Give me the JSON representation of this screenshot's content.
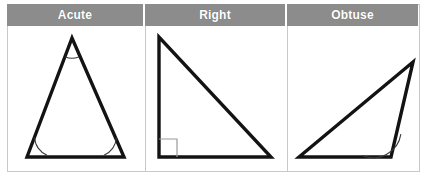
{
  "figure": {
    "columns": [
      {
        "id": "acute",
        "header": "Acute",
        "angle_marker": "arc",
        "marked_angles": [
          "apex",
          "bottom-left",
          "bottom-right"
        ]
      },
      {
        "id": "right",
        "header": "Right",
        "angle_marker": "square",
        "marked_angles": [
          "bottom-left"
        ]
      },
      {
        "id": "obtuse",
        "header": "Obtuse",
        "angle_marker": "arc",
        "marked_angles": [
          "bottom-right"
        ]
      }
    ],
    "colors": {
      "header_background": "#8c8c8c",
      "header_text": "#ffffff",
      "outline": "#131313",
      "border": "#c9c9c9",
      "arc": "#3a3a3a",
      "right_angle_mark": "#9a9a9a",
      "panel_background": "#ffffff"
    }
  }
}
